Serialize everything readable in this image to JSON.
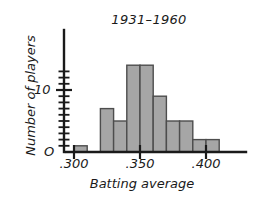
{
  "chart_data": {
    "type": "bar",
    "title": "1931–1960",
    "xlabel": "Batting average",
    "ylabel": "Number of players",
    "origin_label": "O",
    "grid": false,
    "legend": null,
    "xlim": [
      0.29,
      0.43
    ],
    "ylim": [
      0,
      15
    ],
    "bin_width": 0.01,
    "x_tick_labels": [
      ".300",
      ".350",
      ".400"
    ],
    "x_tick_values": [
      0.3,
      0.35,
      0.4
    ],
    "y_tick_labels": [
      "10"
    ],
    "y_tick_values": [
      10
    ],
    "y_minor_tick_values": [
      1,
      2,
      3,
      4,
      5,
      6,
      7,
      8,
      9,
      11,
      12,
      13
    ],
    "bar_color": "#a6a6a6",
    "bar_edge_color": "#4d4d4d",
    "axis_color": "#1a1a1a",
    "categories": [
      ".300-.310",
      ".310-.320",
      ".320-.330",
      ".330-.340",
      ".340-.350",
      ".350-.360",
      ".360-.370",
      ".370-.380",
      ".380-.390",
      ".390-.400",
      ".400-.410",
      ".410-.420"
    ],
    "bin_starts": [
      0.3,
      0.31,
      0.32,
      0.33,
      0.34,
      0.35,
      0.36,
      0.37,
      0.38,
      0.39,
      0.4,
      0.41
    ],
    "values": [
      1,
      0,
      7,
      5,
      14,
      14,
      9,
      5,
      5,
      2,
      2,
      0
    ]
  }
}
